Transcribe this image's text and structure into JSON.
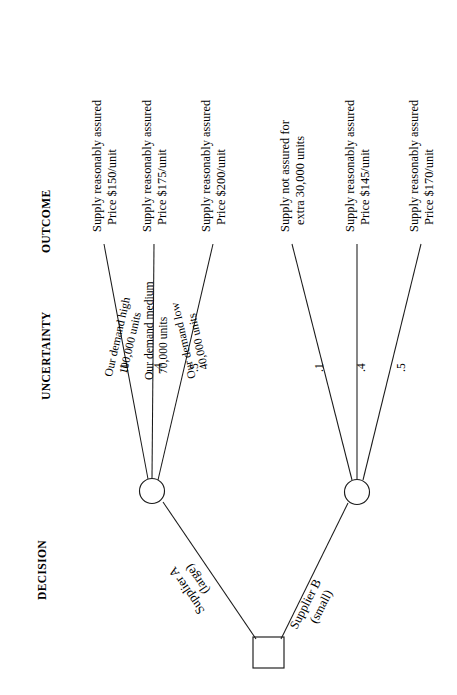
{
  "diagram": {
    "type": "decision-tree",
    "orientation": "rotated-90-ccw",
    "columns": [
      {
        "id": "outcome",
        "label": "OUTCOME"
      },
      {
        "id": "uncertainty",
        "label": "UNCERTAINTY"
      },
      {
        "id": "decision",
        "label": "DECISION"
      }
    ],
    "decision_node": {
      "shape": "square",
      "branches": [
        {
          "id": "supplier-a",
          "line1": "Supplier A",
          "line2": "(large)"
        },
        {
          "id": "supplier-b",
          "line1": "Supplier B",
          "line2": "(small)"
        }
      ]
    },
    "chance_nodes": [
      {
        "id": "chance-node-a",
        "parent": "supplier-a",
        "branches": [
          {
            "probability": ".1",
            "line1": "Our demand high",
            "line2": "100,000 units",
            "outcome_line1": "Supply reasonably assured",
            "outcome_line2": "Price $150/unit"
          },
          {
            "probability": ".4",
            "line1": "Our demand medium",
            "line2": "70,000 units",
            "outcome_line1": "Supply reasonably assured",
            "outcome_line2": "Price $175/unit"
          },
          {
            "probability": ".5",
            "line1": "Our demand low",
            "line2": "40,000 units",
            "outcome_line1": "Supply reasonably assured",
            "outcome_line2": "Price $200/unit"
          }
        ]
      },
      {
        "id": "chance-node-b",
        "parent": "supplier-b",
        "branches": [
          {
            "probability": ".1",
            "line1": "",
            "line2": "",
            "outcome_line1": "Supply not assured for",
            "outcome_line2": "extra 30,000 units"
          },
          {
            "probability": ".4",
            "line1": "",
            "line2": "",
            "outcome_line1": "Supply reasonably assured",
            "outcome_line2": "Price $145/unit"
          },
          {
            "probability": ".5",
            "line1": "",
            "line2": "",
            "outcome_line1": "Supply reasonably assured",
            "outcome_line2": "Price $170/unit"
          }
        ]
      }
    ]
  },
  "colors": {
    "background": "#ffffff",
    "ink": "#1a1a1a"
  }
}
